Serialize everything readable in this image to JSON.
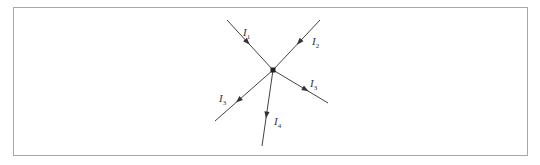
{
  "diagram": {
    "type": "circuit-junction",
    "node": {
      "x": 273,
      "y": 70
    },
    "branches": [
      {
        "id": "I1",
        "label": "I",
        "subscript": "1",
        "direction": "into node",
        "end": {
          "x": 227,
          "y": 20
        },
        "label_pos": {
          "x": 243,
          "y": 36
        }
      },
      {
        "id": "I2",
        "label": "I",
        "subscript": "2",
        "direction": "into node",
        "end": {
          "x": 320,
          "y": 20
        },
        "label_pos": {
          "x": 312,
          "y": 45
        }
      },
      {
        "id": "I3",
        "label": "I",
        "subscript": "3",
        "direction": "out of node",
        "end": {
          "x": 328,
          "y": 103
        },
        "label_pos": {
          "x": 310,
          "y": 87
        }
      },
      {
        "id": "I4",
        "label": "I",
        "subscript": "4",
        "direction": "out of node",
        "end": {
          "x": 262,
          "y": 146
        },
        "label_pos": {
          "x": 274,
          "y": 125
        }
      },
      {
        "id": "I5",
        "label": "I",
        "subscript": "3",
        "direction": "out of node",
        "end": {
          "x": 215,
          "y": 121
        },
        "label_pos": {
          "x": 219,
          "y": 102
        }
      }
    ],
    "colors": {
      "line": "#444444",
      "frame": "#a8a8a8",
      "node": "#222222"
    }
  }
}
